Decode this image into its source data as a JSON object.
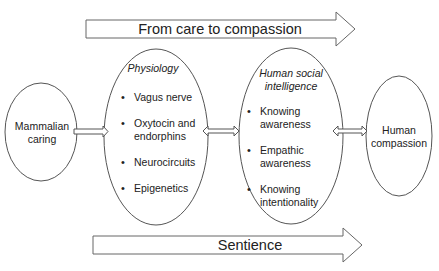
{
  "top_arrow": {
    "label": "From care to compassion"
  },
  "bottom_arrow": {
    "label": "Sentience"
  },
  "nodes": {
    "mammalian": {
      "label_line1": "Mammalian",
      "label_line2": "caring"
    },
    "physiology": {
      "title": "Physiology",
      "items": [
        "Vagus nerve",
        "Oxytocin and endorphins",
        "Neurocircuits",
        "Epigenetics"
      ]
    },
    "social_intelligence": {
      "title_line1": "Human social",
      "title_line2": "intelligence",
      "items": [
        "Knowing awareness",
        "Empathic awareness",
        "Knowing intentionality"
      ]
    },
    "compassion": {
      "label_line1": "Human",
      "label_line2": "compassion"
    }
  },
  "connectors": [
    {
      "from": "mammalian",
      "to": "physiology",
      "type": "single-arrow"
    },
    {
      "from": "physiology",
      "to": "social_intelligence",
      "type": "double-arrow"
    },
    {
      "from": "social_intelligence",
      "to": "compassion",
      "type": "double-arrow"
    }
  ],
  "colors": {
    "stroke": "#555555",
    "text": "#222222",
    "background": "#ffffff"
  }
}
